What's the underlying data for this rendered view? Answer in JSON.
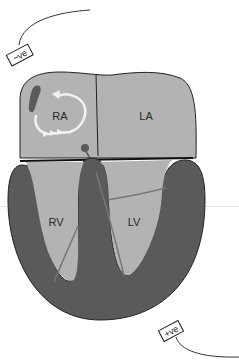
{
  "diagram": {
    "title": "",
    "chambers": {
      "right_atrium": "RA",
      "left_atrium": "LA",
      "right_ventricle": "RV",
      "left_ventricle": "LV"
    },
    "electrodes": {
      "negative": "−ve",
      "positive": "+ve"
    },
    "colors": {
      "chamber_fill": "#b3b3b3",
      "myocardium": "#5a5a5a",
      "outline": "#222222",
      "conduction": "#6e6e6e",
      "circuit_arrow": "#f2f2f2",
      "background": "#ffffff"
    }
  }
}
